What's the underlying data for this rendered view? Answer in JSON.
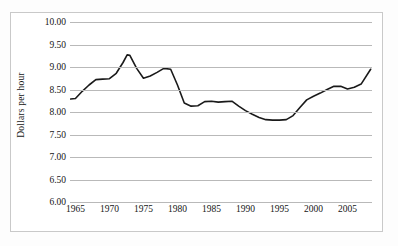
{
  "chart_data": {
    "type": "line",
    "title": "",
    "xlabel": "",
    "ylabel": "Dollars per hour",
    "xlim": [
      1964.2,
      2008.6
    ],
    "ylim": [
      6.0,
      10.0
    ],
    "ytick_labels": [
      "10.00",
      "9.50",
      "9.00",
      "8.50",
      "8.00",
      "7.50",
      "7.00",
      "6.50",
      "6.00"
    ],
    "ytick_values": [
      10.0,
      9.5,
      9.0,
      8.5,
      8.0,
      7.5,
      7.0,
      6.5,
      6.0
    ],
    "xtick_labels": [
      "1965",
      "1970",
      "1975",
      "1980",
      "1985",
      "1990",
      "1995",
      "2000",
      "2005"
    ],
    "xtick_values": [
      1965,
      1970,
      1975,
      1980,
      1985,
      1990,
      1995,
      2000,
      2005
    ],
    "grid": "horizontal",
    "legend": "none",
    "line_color": "#1a1a1a",
    "line_width": 1.6,
    "series": [
      {
        "name": "Real wage",
        "x": [
          1964.3,
          1965,
          1966,
          1967,
          1968,
          1969,
          1970,
          1971,
          1972,
          1972.6,
          1973,
          1974,
          1975,
          1976,
          1977,
          1978,
          1979,
          1980,
          1981,
          1982,
          1983,
          1984,
          1985,
          1986,
          1987,
          1988,
          1989,
          1990,
          1991,
          1992,
          1993,
          1994,
          1995,
          1996,
          1997,
          1998,
          1999,
          2000,
          2001,
          2002,
          2003,
          2004,
          2005,
          2006,
          2007,
          2008.4
        ],
        "values": [
          8.29,
          8.3,
          8.46,
          8.6,
          8.72,
          8.73,
          8.74,
          8.86,
          9.1,
          9.27,
          9.26,
          8.97,
          8.75,
          8.8,
          8.88,
          8.97,
          8.95,
          8.6,
          8.2,
          8.13,
          8.14,
          8.23,
          8.24,
          8.22,
          8.23,
          8.24,
          8.13,
          8.03,
          7.95,
          7.88,
          7.83,
          7.82,
          7.82,
          7.83,
          7.92,
          8.1,
          8.27,
          8.35,
          8.42,
          8.5,
          8.57,
          8.57,
          8.51,
          8.55,
          8.62,
          8.95
        ]
      }
    ]
  },
  "axis": {
    "y_title": "Dollars per hour"
  }
}
